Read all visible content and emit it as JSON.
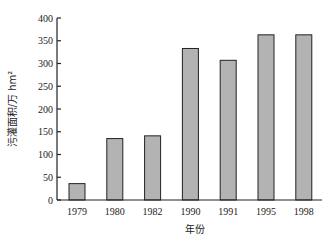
{
  "chart_data": {
    "type": "bar",
    "title": "",
    "xlabel": "年份",
    "ylabel": "污灌面积/万 hm²",
    "categories": [
      "1979",
      "1980",
      "1982",
      "1990",
      "1991",
      "1995",
      "1998"
    ],
    "values": [
      36,
      135,
      141,
      333,
      307,
      363,
      363
    ],
    "ylim": [
      0,
      400
    ],
    "yticks": [
      0,
      50,
      100,
      150,
      200,
      250,
      300,
      350,
      400
    ],
    "grid": false,
    "legend": "none",
    "colors": {
      "bar_fill": "#b3b3b3",
      "bar_stroke": "#222222",
      "axis": "#222222"
    }
  }
}
